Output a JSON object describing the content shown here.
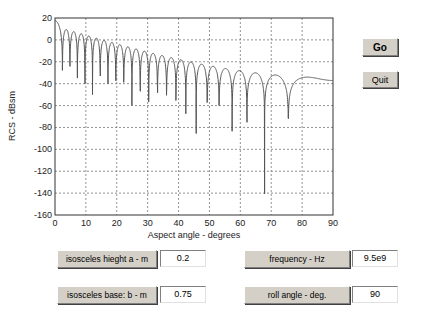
{
  "buttons": {
    "go": "Go",
    "quit": "Quit"
  },
  "params": [
    {
      "label": "isosceles hieght a - m",
      "value": "0.2"
    },
    {
      "label": "isosceles base: b - m",
      "value": "0.75"
    },
    {
      "label": "frequency - Hz",
      "value": "9.5e9"
    },
    {
      "label": "roll angle - deg.",
      "value": "90"
    }
  ],
  "chart_data": {
    "type": "line",
    "title": "",
    "xlabel": "Aspect angle - degrees",
    "ylabel": "RCS - dBsm",
    "xlim": [
      0,
      90
    ],
    "ylim": [
      -160,
      20
    ],
    "xticks": [
      0,
      10,
      20,
      30,
      40,
      50,
      60,
      70,
      80,
      90
    ],
    "yticks": [
      20,
      0,
      -20,
      -40,
      -60,
      -80,
      -100,
      -120,
      -140,
      -160
    ],
    "grid": true,
    "series": [
      {
        "name": "RCS",
        "color": "#555555",
        "x": [
          0,
          1,
          2.4,
          3.6,
          4.8,
          6,
          7.3,
          8.5,
          9.7,
          10.9,
          12.2,
          13.4,
          14.6,
          15.9,
          17.1,
          18.4,
          19.7,
          21,
          22.3,
          23.6,
          24.9,
          26.2,
          27.6,
          28.9,
          30.3,
          31.7,
          33.2,
          34.6,
          36.1,
          37.6,
          39.2,
          40.8,
          42.4,
          44.1,
          45.9,
          47.7,
          49.6,
          51.6,
          53.7,
          55.9,
          58.3,
          60.2,
          62.6,
          64.9,
          67.8,
          71.5,
          75.7,
          81,
          85,
          90
        ],
        "values": [
          17,
          12,
          -130,
          -8,
          -80,
          -18,
          -115,
          -24,
          -90,
          -28,
          -105,
          -32,
          -100,
          -35,
          -140,
          -38,
          -145,
          -40,
          -100,
          -42,
          -120,
          -44,
          -110,
          -46,
          -100,
          -47,
          -110,
          -49,
          -105,
          -50,
          -100,
          -52,
          -110,
          -53,
          -105,
          -55,
          -100,
          -57,
          -95,
          -59,
          -110,
          -61,
          -108,
          -64,
          -142,
          -66,
          -118,
          -70,
          -72,
          -77
        ]
      }
    ],
    "model": {
      "lambda_over_b": 0.0421,
      "peak_db": 17.5,
      "decay_db_per_lobe": 2.2
    }
  }
}
